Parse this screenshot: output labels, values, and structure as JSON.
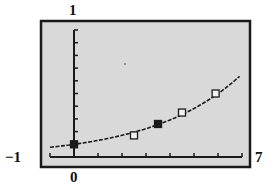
{
  "chart_data": {
    "type": "scatter",
    "title": "",
    "xlabel": "",
    "ylabel": "",
    "xlim": [
      -1,
      7
    ],
    "ylim": [
      0,
      1
    ],
    "x_tick_step": 1,
    "y_tick_step": 0.1,
    "grid": false,
    "legend": null,
    "window_labels": {
      "ymax": "1",
      "xmin": "-1",
      "xmax": "7",
      "x_origin": "0"
    },
    "series": [
      {
        "name": "fitted curve",
        "type": "line",
        "style": "dashed",
        "equation_estimate": "y = 0.1 * e^(0.268x)",
        "x": [
          -1,
          0,
          1,
          2,
          3,
          4,
          5,
          6,
          6.9
        ],
        "y": [
          0.077,
          0.1,
          0.131,
          0.171,
          0.223,
          0.292,
          0.382,
          0.499,
          0.636
        ]
      },
      {
        "name": "data points (filled)",
        "type": "scatter",
        "marker": "filled-square",
        "x": [
          0,
          3.5
        ],
        "y": [
          0.1,
          0.26
        ]
      },
      {
        "name": "data points (open)",
        "type": "scatter",
        "marker": "open-square",
        "x": [
          2.5,
          4.5,
          5.9
        ],
        "y": [
          0.17,
          0.35,
          0.5
        ]
      }
    ],
    "colors": {
      "background": "#d9d9d9",
      "frame": "#1a1a1a",
      "curve": "#1a1a1a"
    }
  }
}
